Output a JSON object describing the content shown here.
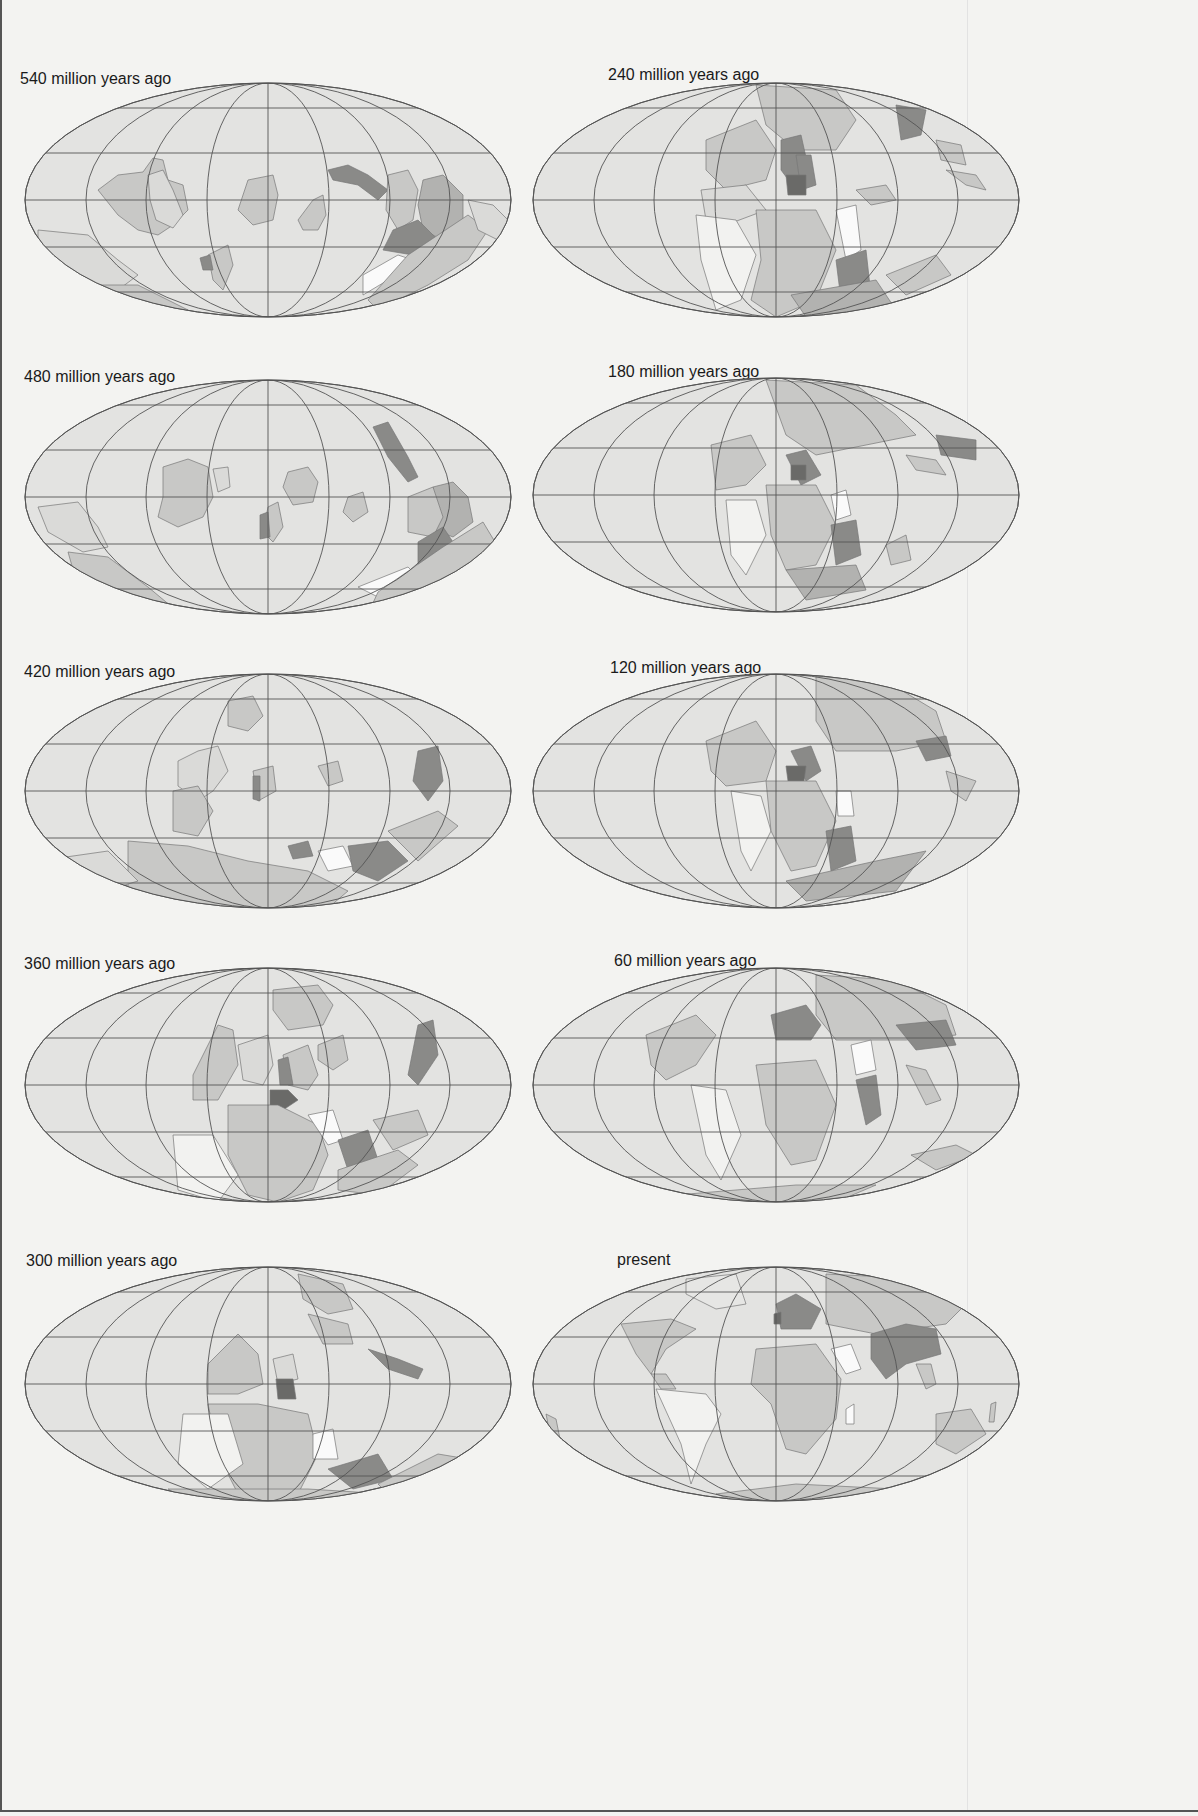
{
  "page": {
    "colors": {
      "background": "#f3f3f1",
      "ocean": "#e3e3e1",
      "graticule": "#555555",
      "land_light": "#c8c8c6",
      "land_medium": "#b2b2b0",
      "land_dark": "#8a8a88",
      "land_darkest": "#6a6a68",
      "land_white": "#fafafa"
    }
  },
  "maps": [
    {
      "label": "540 million years ago",
      "column": "left",
      "row": 0
    },
    {
      "label": "480 million years ago",
      "column": "left",
      "row": 1
    },
    {
      "label": "420 million years ago",
      "column": "left",
      "row": 2
    },
    {
      "label": "360 million years ago",
      "column": "left",
      "row": 3
    },
    {
      "label": "300 million years ago",
      "column": "left",
      "row": 4
    },
    {
      "label": "240 million years ago",
      "column": "right",
      "row": 0
    },
    {
      "label": "180 million years ago",
      "column": "right",
      "row": 1
    },
    {
      "label": "120 million years ago",
      "column": "right",
      "row": 2
    },
    {
      "label": "60 million years ago",
      "column": "right",
      "row": 3
    },
    {
      "label": "present",
      "column": "right",
      "row": 4
    }
  ]
}
